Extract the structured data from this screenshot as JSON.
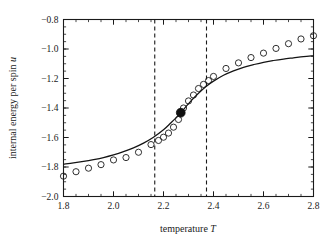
{
  "figure": {
    "background_color": "#ffffff",
    "ink_color": "#1a1a1a"
  },
  "chart_data": {
    "type": "scatter",
    "title": "",
    "subtitle": "",
    "xlabel": "temperature T",
    "xlabel_plain": "temperature",
    "xlabel_symbol": "T",
    "ylabel": "internal energy per spin u",
    "ylabel_plain": "internal energy per spin",
    "ylabel_symbol": "u",
    "xlim": [
      1.8,
      2.8
    ],
    "ylim": [
      -2.0,
      -0.8
    ],
    "grid": false,
    "legend": "none",
    "x_major_ticks": [
      1.8,
      2.0,
      2.2,
      2.4,
      2.6,
      2.8
    ],
    "x_major_tick_labels": [
      "1.8",
      "2.0",
      "2.2",
      "2.4",
      "2.6",
      "2.8"
    ],
    "x_minor_tick_step": 0.05,
    "y_major_ticks": [
      -2.0,
      -1.8,
      -1.6,
      -1.4,
      -1.2,
      -1.0,
      -0.8
    ],
    "y_major_tick_labels": [
      "-2.0",
      "-1.8",
      "-1.6",
      "-1.4",
      "-1.2",
      "-1.0",
      "-0.8"
    ],
    "y_minor_tick_step": 0.05,
    "ticks_direction": "in",
    "series": [
      {
        "name": "simulation data",
        "marker": "open-circle",
        "marker_size": 3.1,
        "x": [
          1.8,
          1.85,
          1.9,
          1.95,
          2.0,
          2.05,
          2.1,
          2.15,
          2.18,
          2.2,
          2.22,
          2.24,
          2.26,
          2.27,
          2.28,
          2.3,
          2.32,
          2.34,
          2.36,
          2.38,
          2.4,
          2.45,
          2.5,
          2.55,
          2.6,
          2.65,
          2.7,
          2.75,
          2.8
        ],
        "y": [
          -1.862,
          -1.832,
          -1.808,
          -1.784,
          -1.752,
          -1.736,
          -1.7,
          -1.648,
          -1.62,
          -1.598,
          -1.57,
          -1.53,
          -1.478,
          -1.432,
          -1.4,
          -1.352,
          -1.312,
          -1.268,
          -1.24,
          -1.214,
          -1.186,
          -1.132,
          -1.094,
          -1.058,
          -1.028,
          -0.996,
          -0.964,
          -0.932,
          -0.91
        ]
      },
      {
        "name": "critical point",
        "marker": "filled-circle",
        "marker_size": 4.4,
        "x": [
          2.269
        ],
        "y": [
          -1.432
        ]
      },
      {
        "name": "exact solution",
        "marker": "none",
        "line": "solid",
        "x": [
          1.8,
          1.84,
          1.88,
          1.92,
          1.96,
          2.0,
          2.04,
          2.08,
          2.12,
          2.16,
          2.2,
          2.23,
          2.26,
          2.269,
          2.28,
          2.31,
          2.34,
          2.37,
          2.4,
          2.44,
          2.48,
          2.52,
          2.56,
          2.6,
          2.64,
          2.68,
          2.72,
          2.76,
          2.8
        ],
        "y": [
          -1.78,
          -1.772,
          -1.762,
          -1.75,
          -1.736,
          -1.718,
          -1.696,
          -1.67,
          -1.638,
          -1.598,
          -1.548,
          -1.5,
          -1.45,
          -1.432,
          -1.41,
          -1.352,
          -1.3,
          -1.254,
          -1.218,
          -1.178,
          -1.148,
          -1.124,
          -1.106,
          -1.09,
          -1.078,
          -1.068,
          -1.06,
          -1.052,
          -1.046
        ]
      }
    ],
    "annotations": [
      {
        "name": "left-transition-bound",
        "type": "vertical-dashed-line",
        "x": 2.165
      },
      {
        "name": "right-transition-bound",
        "type": "vertical-dashed-line",
        "x": 2.372
      }
    ]
  }
}
